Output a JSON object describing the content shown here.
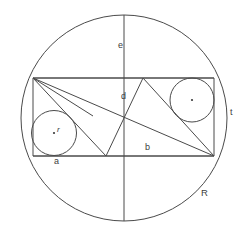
{
  "figure": {
    "background_color": "#ffffff",
    "line_color": "#4a4a4a",
    "canvas": {
      "width": 248,
      "height": 235
    }
  },
  "shapes": {
    "outer_circle": {
      "name": "R",
      "cx": 124,
      "cy": 118,
      "r": 103
    },
    "rectangle": {
      "x1": 33,
      "y1": 78,
      "x2": 214,
      "y2": 156
    },
    "vertical_diameter": {
      "x": 124,
      "y1": 15,
      "y2": 221
    },
    "inner_circle_left": {
      "name": "r",
      "cx": 54,
      "cy": 133,
      "r": 22.5
    },
    "inner_circle_right": {
      "name": "r",
      "cx": 192,
      "cy": 100,
      "r": 22
    },
    "polyline_left_triangle": "33,78 106,156 143,78",
    "diagonal_main": "33,78 214,156",
    "diagonal_secondary": "143,78 214,156",
    "chord_lower": "33,78 214,156"
  },
  "labels": {
    "e": {
      "text": "e",
      "x": 118,
      "y": 41
    },
    "d": {
      "text": "d",
      "x": 121,
      "y": 92
    },
    "b": {
      "text": "b",
      "x": 145,
      "y": 143
    },
    "a": {
      "text": "a",
      "x": 54,
      "y": 157
    },
    "r_left": {
      "text": "r",
      "x": 57,
      "y": 126
    },
    "t": {
      "text": "t",
      "x": 230,
      "y": 108
    },
    "R": {
      "text": "R",
      "x": 201,
      "y": 188
    }
  }
}
